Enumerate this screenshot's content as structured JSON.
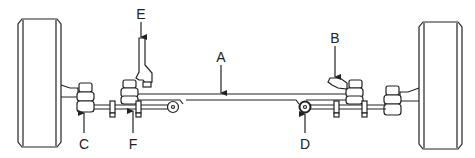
{
  "diagram": {
    "type": "steering linkage / front axle diagram",
    "colors": {
      "stroke": "#222222",
      "background": "#ffffff"
    },
    "labels": [
      {
        "id": "A",
        "text": "A",
        "x": 221,
        "y": 50,
        "points_to": "axle-beam"
      },
      {
        "id": "B",
        "text": "B",
        "x": 335,
        "y": 31,
        "points_to": "right-steering-arm"
      },
      {
        "id": "C",
        "text": "C",
        "x": 84,
        "y": 137,
        "points_to": "left-tie-rod-end"
      },
      {
        "id": "D",
        "text": "D",
        "x": 305,
        "y": 137,
        "points_to": "right-idler-pivot"
      },
      {
        "id": "E",
        "text": "E",
        "x": 141,
        "y": 7,
        "points_to": "pitman-arm"
      },
      {
        "id": "F",
        "text": "F",
        "x": 133,
        "y": 137,
        "points_to": "adjusting-sleeve"
      }
    ]
  }
}
